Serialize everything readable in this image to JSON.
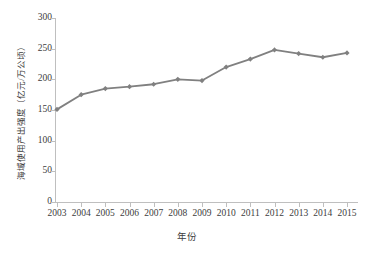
{
  "chart_data": {
    "type": "line",
    "title": "",
    "xlabel": "年份",
    "ylabel": "海域使用产出强度（亿元/万公顷）",
    "categories": [
      "2003",
      "2004",
      "2005",
      "2006",
      "2007",
      "2008",
      "2009",
      "2010",
      "2011",
      "2012",
      "2013",
      "2014",
      "2015"
    ],
    "values": [
      151,
      175,
      185,
      188,
      192,
      200,
      198,
      220,
      233,
      248,
      242,
      236,
      243
    ],
    "series": [
      {
        "name": "海域使用产出强度",
        "values": [
          151,
          175,
          185,
          188,
          192,
          200,
          198,
          220,
          233,
          248,
          242,
          236,
          243
        ]
      }
    ],
    "ylim": [
      0,
      300
    ],
    "ytick_step": 50,
    "yticks": [
      "0",
      "50",
      "100",
      "150",
      "200",
      "250",
      "300"
    ],
    "xticks": [
      "2003",
      "2004",
      "2005",
      "2006",
      "2007",
      "2008",
      "2009",
      "2010",
      "2011",
      "2012",
      "2013",
      "2014",
      "2015"
    ],
    "grid": false,
    "legend": false,
    "legend_position": "none",
    "marker": "diamond",
    "colors": {
      "series_line": "#808080",
      "series_marker": "#808080",
      "axis": "#bfbfbf",
      "text": "#3d3d3d",
      "background": "#ffffff"
    }
  }
}
